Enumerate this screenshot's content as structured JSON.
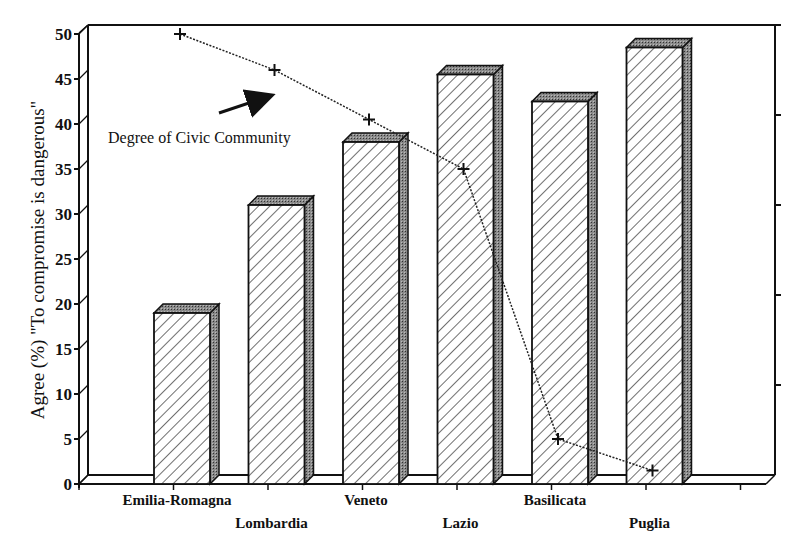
{
  "chart_data": {
    "type": "bar",
    "title": "",
    "xlabel": "",
    "ylabel": "Agree (%) \"To compromise is dangerous\"",
    "ylim": [
      0,
      50
    ],
    "yticks": [
      0,
      5,
      10,
      15,
      20,
      25,
      30,
      35,
      40,
      45,
      50
    ],
    "categories": [
      "Emilia-Romagna",
      "Lombardia",
      "Veneto",
      "Lazio",
      "Basilicata",
      "Puglia"
    ],
    "series": [
      {
        "name": "Agree (%) \"To compromise is dangerous\"",
        "type": "bar",
        "style": "3D hatched bars",
        "values": [
          19,
          31,
          38,
          45.5,
          42.5,
          48.5
        ]
      },
      {
        "name": "Degree of Civic Community",
        "type": "line",
        "axis": "secondary (unlabeled right axis)",
        "style": "dotted line with + markers",
        "values_on_left_scale": [
          50,
          46,
          40.5,
          35,
          5,
          1.5
        ]
      }
    ],
    "secondary_axis": {
      "position": "right",
      "tick_labels": [],
      "tick_count": 5
    },
    "annotations": [
      {
        "text": "Degree of Civic Community",
        "arrow": "points up-right toward line"
      }
    ],
    "grid": false,
    "legend": "none (inline annotation)"
  }
}
